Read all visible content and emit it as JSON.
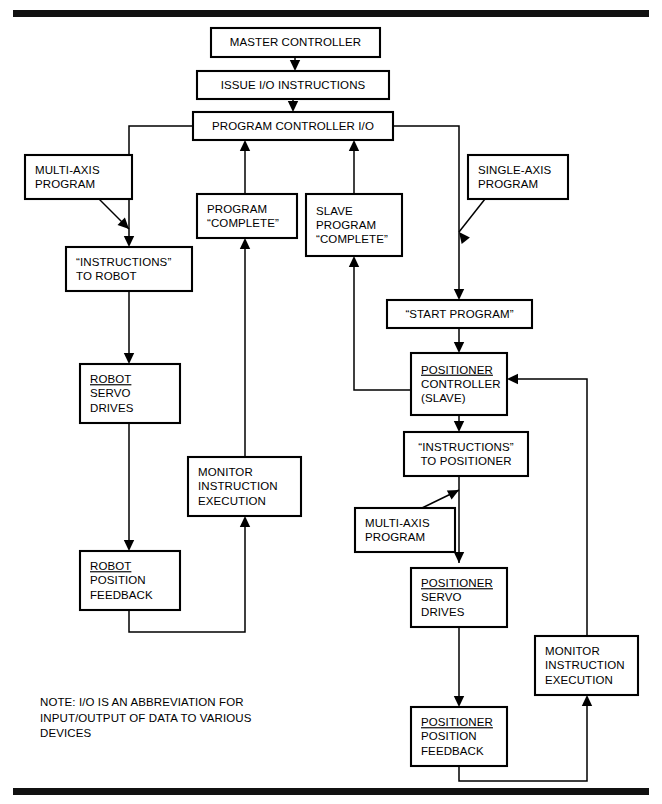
{
  "figure": {
    "background_color": "#ffffff",
    "line_color": "#000000",
    "rule_color": "#111111",
    "width": 662,
    "height": 804
  },
  "chart_data": {
    "type": "diagram",
    "nodes": [
      {
        "id": "master_controller",
        "label": "MASTER CONTROLLER",
        "lines": [
          "MASTER CONTROLLER"
        ],
        "underline_first": false,
        "align": "center",
        "x": 211,
        "y": 28,
        "w": 169,
        "h": 29
      },
      {
        "id": "issue_io",
        "label": "ISSUE I/O INSTRUCTIONS",
        "lines": [
          "ISSUE I/O INSTRUCTIONS"
        ],
        "underline_first": false,
        "align": "center",
        "x": 197,
        "y": 71,
        "w": 192,
        "h": 28
      },
      {
        "id": "program_controller_io",
        "label": "PROGRAM CONTROLLER I/O",
        "lines": [
          "PROGRAM CONTROLLER I/O"
        ],
        "underline_first": false,
        "align": "center",
        "x": 193,
        "y": 112,
        "w": 200,
        "h": 28
      },
      {
        "id": "multi_axis_program_1",
        "label": "MULTI-AXIS PROGRAM",
        "lines": [
          "MULTI-AXIS",
          "PROGRAM"
        ],
        "underline_first": false,
        "align": "left",
        "x": 25,
        "y": 155,
        "w": 107,
        "h": 44
      },
      {
        "id": "single_axis_program",
        "label": "SINGLE-AXIS PROGRAM",
        "lines": [
          "SINGLE-AXIS",
          "PROGRAM"
        ],
        "underline_first": false,
        "align": "left",
        "x": 468,
        "y": 155,
        "w": 100,
        "h": 44
      },
      {
        "id": "program_complete",
        "label": "PROGRAM “COMPLETE”",
        "lines": [
          "PROGRAM",
          "“COMPLETE”"
        ],
        "underline_first": false,
        "align": "left",
        "x": 197,
        "y": 194,
        "w": 100,
        "h": 44
      },
      {
        "id": "slave_program_complete",
        "label": "SLAVE PROGRAM “COMPLETE”",
        "lines": [
          "SLAVE",
          "PROGRAM",
          "“COMPLETE”"
        ],
        "underline_first": false,
        "align": "left",
        "x": 306,
        "y": 194,
        "w": 96,
        "h": 62
      },
      {
        "id": "instructions_to_robot",
        "label": "“INSTRUCTIONS” TO ROBOT",
        "lines": [
          "“INSTRUCTIONS”",
          "TO ROBOT"
        ],
        "underline_first": false,
        "align": "left",
        "x": 66,
        "y": 247,
        "w": 126,
        "h": 44
      },
      {
        "id": "start_program",
        "label": "“START PROGRAM”",
        "lines": [
          "“START PROGRAM”"
        ],
        "underline_first": false,
        "align": "center",
        "x": 387,
        "y": 300,
        "w": 145,
        "h": 28
      },
      {
        "id": "positioner_controller",
        "label": "POSITIONER CONTROLLER (SLAVE)",
        "lines": [
          "POSITIONER",
          "CONTROLLER",
          "(SLAVE)"
        ],
        "underline_first": true,
        "align": "left",
        "x": 411,
        "y": 353,
        "w": 96,
        "h": 62
      },
      {
        "id": "robot_servo_drives",
        "label": "ROBOT SERVO DRIVES",
        "lines": [
          "ROBOT",
          "SERVO",
          "DRIVES"
        ],
        "underline_first": true,
        "align": "left",
        "x": 80,
        "y": 364,
        "w": 100,
        "h": 59
      },
      {
        "id": "instructions_positioner",
        "label": "“INSTRUCTIONS” TO POSITIONER",
        "lines": [
          "“INSTRUCTIONS”",
          "TO POSITIONER"
        ],
        "underline_first": false,
        "align": "center",
        "x": 404,
        "y": 432,
        "w": 124,
        "h": 44
      },
      {
        "id": "monitor_left",
        "label": "MONITOR INSTRUCTION EXECUTION",
        "lines": [
          "MONITOR",
          "INSTRUCTION",
          "EXECUTION"
        ],
        "underline_first": false,
        "align": "left",
        "x": 188,
        "y": 457,
        "w": 113,
        "h": 59
      },
      {
        "id": "multi_axis_program_2",
        "label": "MULTI-AXIS PROGRAM",
        "lines": [
          "MULTI-AXIS",
          "PROGRAM"
        ],
        "underline_first": false,
        "align": "left",
        "x": 355,
        "y": 508,
        "w": 100,
        "h": 44
      },
      {
        "id": "positioner_servo",
        "label": "POSITIONER SERVO DRIVES",
        "lines": [
          "POSITIONER",
          "SERVO",
          "DRIVES"
        ],
        "underline_first": true,
        "align": "left",
        "x": 411,
        "y": 568,
        "w": 96,
        "h": 59
      },
      {
        "id": "robot_position_feedback",
        "label": "ROBOT POSITION FEEDBACK",
        "lines": [
          "ROBOT",
          "POSITION",
          "FEEDBACK"
        ],
        "underline_first": true,
        "align": "left",
        "x": 80,
        "y": 551,
        "w": 100,
        "h": 59
      },
      {
        "id": "monitor_right",
        "label": "MONITOR INSTRUCTION EXECUTION",
        "lines": [
          "MONITOR",
          "INSTRUCTION",
          "EXECUTION"
        ],
        "underline_first": false,
        "align": "left",
        "x": 535,
        "y": 636,
        "w": 103,
        "h": 59
      },
      {
        "id": "positioner_feedback",
        "label": "POSITIONER POSITION FEEDBACK",
        "lines": [
          "POSITIONER",
          "POSITION",
          "FEEDBACK"
        ],
        "underline_first": true,
        "align": "left",
        "x": 411,
        "y": 707,
        "w": 96,
        "h": 59
      }
    ],
    "edges": [
      {
        "id": "e-master-issue",
        "from": "master_controller",
        "to": "issue_io",
        "path": "M295,57 L295,66",
        "arrow": "down",
        "arrow_at": [
          295,
          71
        ]
      },
      {
        "id": "e-issue-progctl",
        "from": "issue_io",
        "to": "program_controller_io",
        "path": "M293,99 L293,107",
        "arrow": "down",
        "arrow_at": [
          293,
          112
        ]
      },
      {
        "id": "e-progctl-robot",
        "from": "program_controller_io",
        "to": "instructions_to_robot",
        "path": "M193,126 L129,126 L129,242",
        "arrow": "down",
        "arrow_at": [
          129,
          247
        ]
      },
      {
        "id": "e-progctl-start",
        "from": "program_controller_io",
        "to": "start_program",
        "path": "M393,126 L459,126 L459,295",
        "arrow": "down",
        "arrow_at": [
          459,
          300
        ]
      },
      {
        "id": "e-multiaxis1-robot",
        "from": "multi_axis_program_1",
        "to": "instructions_to_robot",
        "path": "M99,199 L129,229",
        "arrow": "diag",
        "arrow_at": [
          129,
          229
        ],
        "angle": 45
      },
      {
        "id": "e-singleaxis-start",
        "from": "single_axis_program",
        "to": "start_program",
        "path": "M485,199 L459,232",
        "arrow": "diag",
        "arrow_at": [
          459,
          232
        ],
        "angle": 232
      },
      {
        "id": "e-progcomplete-progctl",
        "from": "program_complete",
        "to": "program_controller_io",
        "path": "M245,194 L245,145",
        "arrow": "up",
        "arrow_at": [
          245,
          140
        ]
      },
      {
        "id": "e-slavecomplete-progctl",
        "from": "slave_program_complete",
        "to": "program_controller_io",
        "path": "M354,194 L354,145",
        "arrow": "up",
        "arrow_at": [
          354,
          140
        ]
      },
      {
        "id": "e-monitorleft-progcomp",
        "from": "monitor_left",
        "to": "program_complete",
        "path": "M245,457 L245,243",
        "arrow": "up",
        "arrow_at": [
          245,
          238
        ]
      },
      {
        "id": "e-robot-servo",
        "from": "instructions_to_robot",
        "to": "robot_servo_drives",
        "path": "M129,291 L129,359",
        "arrow": "down",
        "arrow_at": [
          129,
          364
        ]
      },
      {
        "id": "e-servo-feedback",
        "from": "robot_servo_drives",
        "to": "robot_position_feedback",
        "path": "M129,423 L129,546",
        "arrow": "down",
        "arrow_at": [
          129,
          551
        ]
      },
      {
        "id": "e-feedback-monitorleft",
        "from": "robot_position_feedback",
        "to": "monitor_left",
        "path": "M129,610 L129,632 L245,632 L245,521",
        "arrow": "up",
        "arrow_at": [
          245,
          516
        ]
      },
      {
        "id": "e-start-posctl",
        "from": "start_program",
        "to": "positioner_controller",
        "path": "M459,328 L459,348",
        "arrow": "down",
        "arrow_at": [
          459,
          353
        ]
      },
      {
        "id": "e-posctl-slavecomp",
        "from": "positioner_controller",
        "to": "slave_program_complete",
        "path": "M411,390 L354,390 L354,261",
        "arrow": "up",
        "arrow_at": [
          354,
          256
        ]
      },
      {
        "id": "e-posctl-instr",
        "from": "positioner_controller",
        "to": "instructions_positioner",
        "path": "M459,415 L459,427",
        "arrow": "down",
        "arrow_at": [
          459,
          432
        ]
      },
      {
        "id": "e-instr-posservo",
        "from": "instructions_positioner",
        "to": "positioner_servo",
        "path": "M459,476 L459,563",
        "arrow": "down",
        "arrow_at": [
          459,
          563
        ]
      },
      {
        "id": "e-multiaxis2-instr",
        "from": "multi_axis_program_2",
        "to": "instructions_positioner",
        "path": "M422,508 L459,490",
        "arrow": "diag",
        "arrow_at": [
          459,
          490
        ],
        "angle": 333
      },
      {
        "id": "e-posservo-posfeedback",
        "from": "positioner_servo",
        "to": "positioner_feedback",
        "path": "M459,627 L459,702",
        "arrow": "down",
        "arrow_at": [
          459,
          707
        ]
      },
      {
        "id": "e-posfeedback-monitorrt",
        "from": "positioner_feedback",
        "to": "monitor_right",
        "path": "M459,766 L459,781 L587,781 L587,700",
        "arrow": "up",
        "arrow_at": [
          587,
          695
        ]
      },
      {
        "id": "e-monitorrt-posctl",
        "from": "monitor_right",
        "to": "positioner_controller",
        "path": "M587,636 L587,379 L512,379",
        "arrow": "left",
        "arrow_at": [
          507,
          379
        ]
      }
    ],
    "note": {
      "lines": [
        "NOTE:  I/O IS AN ABBREVIATION FOR",
        "INPUT/OUTPUT OF DATA TO VARIOUS",
        "DEVICES"
      ],
      "x": 40,
      "y": 706
    },
    "rules": [
      {
        "id": "top-rule",
        "x": 13,
        "y": 10,
        "w": 636,
        "h": 7
      },
      {
        "id": "bottom-rule",
        "x": 13,
        "y": 788,
        "w": 636,
        "h": 7
      }
    ]
  }
}
